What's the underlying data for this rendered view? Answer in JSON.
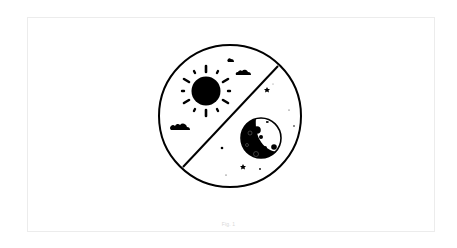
{
  "figure": {
    "caption": "Fig. 1",
    "colors": {
      "background": "#ffffff",
      "frame_border": "#ececec",
      "ink": "#000000",
      "caption": "#d8d8d8"
    },
    "icons": {
      "badge": "day-night-circle-icon",
      "sun": "sun-icon",
      "moon": "moon-icon",
      "clouds": "cloud-icon",
      "stars": "star-icon"
    }
  }
}
